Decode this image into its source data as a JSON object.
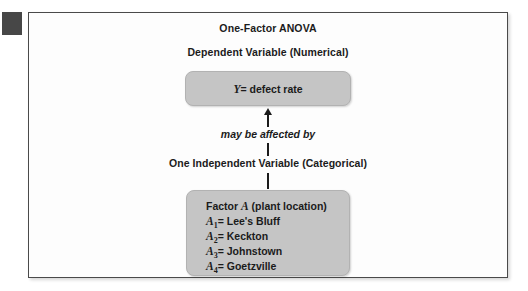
{
  "figure": {
    "title": "One-Factor ANOVA",
    "subtitle": "Dependent Variable (Numerical)",
    "response_box": {
      "symbol": "Y",
      "relation": "= defect rate"
    },
    "affected_label": "may be affected by",
    "independent_label": "One Independent Variable (Categorical)",
    "factor_box": {
      "heading_prefix": "Factor ",
      "heading_symbol": "A",
      "heading_suffix": " (plant location)",
      "levels": [
        {
          "symbol": "A",
          "subscript": "1",
          "relation": "= Lee's Bluff"
        },
        {
          "symbol": "A",
          "subscript": "2",
          "relation": "= Keckton"
        },
        {
          "symbol": "A",
          "subscript": "3",
          "relation": "= Johnstown"
        },
        {
          "symbol": "A",
          "subscript": "4",
          "relation": "= Goetzville"
        }
      ]
    }
  },
  "colors": {
    "box_fill": "#c5c5c5",
    "panel_border": "#4a4a4a",
    "edge_marker": "#474747",
    "text": "#1b1b1b"
  }
}
